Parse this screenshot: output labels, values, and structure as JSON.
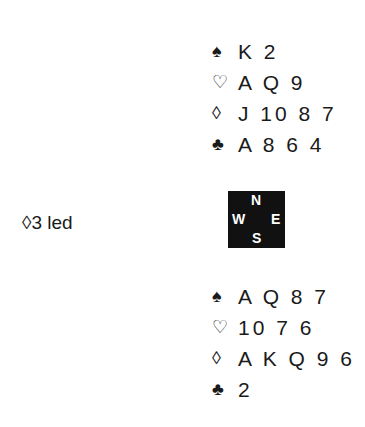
{
  "north": {
    "spades": {
      "symbol": "♠",
      "cards": "K 2"
    },
    "hearts": {
      "symbol": "♡",
      "cards": "A Q 9"
    },
    "diamonds": {
      "symbol": "◊",
      "cards": "J 10 8 7"
    },
    "clubs": {
      "symbol": "♣",
      "cards": "A 8 6 4"
    }
  },
  "south": {
    "spades": {
      "symbol": "♠",
      "cards": "A Q 8 7"
    },
    "hearts": {
      "symbol": "♡",
      "cards": "10 7 6"
    },
    "diamonds": {
      "symbol": "◊",
      "cards": "A K Q 9 6"
    },
    "clubs": {
      "symbol": "♣",
      "cards": "2"
    }
  },
  "lead": {
    "text": "◊3 led"
  },
  "compass": {
    "n": "N",
    "s": "S",
    "w": "W",
    "e": "E"
  }
}
